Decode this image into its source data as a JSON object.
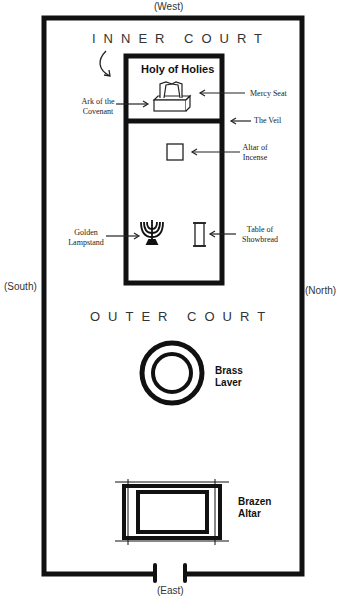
{
  "directions": {
    "west": "(West)",
    "east": "(East)",
    "south": "(South)",
    "north": "(North)"
  },
  "courts": {
    "inner": "INNER COURT",
    "outer": "OUTER COURT"
  },
  "holy_of_holies": {
    "title": "Holy of Holies"
  },
  "labels": {
    "ark_line1": "Ark of the",
    "ark_line2": "Covenant",
    "mercy_seat": "Mercy Seat",
    "veil": "The Veil",
    "altar_incense_line1": "Altar of",
    "altar_incense_line2": "Incense",
    "lampstand_line1": "Golden",
    "lampstand_line2": "Lampstand",
    "showbread_line1": "Table of",
    "showbread_line2": "Showbread",
    "laver_line1": "Brass",
    "laver_line2": "Laver",
    "altar_line1": "Brazen",
    "altar_line2": "Altar"
  }
}
